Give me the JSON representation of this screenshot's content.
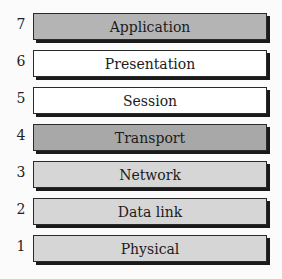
{
  "diagram": {
    "layers": [
      {
        "number": "7",
        "name": "Application",
        "fill": "#b4b4b4"
      },
      {
        "number": "6",
        "name": "Presentation",
        "fill": "#ffffff"
      },
      {
        "number": "5",
        "name": "Session",
        "fill": "#ffffff"
      },
      {
        "number": "4",
        "name": "Transport",
        "fill": "#a8a8a8"
      },
      {
        "number": "3",
        "name": "Network",
        "fill": "#d6d6d6"
      },
      {
        "number": "2",
        "name": "Data link",
        "fill": "#d6d6d6"
      },
      {
        "number": "1",
        "name": "Physical",
        "fill": "#d6d6d6"
      }
    ]
  }
}
